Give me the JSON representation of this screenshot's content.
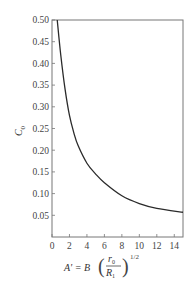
{
  "chart_data": {
    "type": "line",
    "title": "",
    "ylabel": "C_0",
    "ylabel_main": "C",
    "ylabel_sub": "0",
    "xlabel": "A' = B (r_0 / R_1)^(1/2)",
    "xlabel_parts": {
      "lhs": "A' = B",
      "num": "r",
      "num_sub": "0",
      "den": "R",
      "den_sub": "1",
      "exponent": "1/2"
    },
    "xlim": [
      0,
      15
    ],
    "ylim": [
      0,
      0.5
    ],
    "x_ticks": [
      "0",
      "2",
      "4",
      "6",
      "8",
      "10",
      "12",
      "14"
    ],
    "x_tick_values": [
      0,
      2,
      4,
      6,
      8,
      10,
      12,
      14
    ],
    "y_ticks": [
      "0.05",
      "0.10",
      "0.15",
      "0.20",
      "0.25",
      "0.30",
      "0.35",
      "0.40",
      "0.45",
      "0.50"
    ],
    "y_tick_values": [
      0.05,
      0.1,
      0.15,
      0.2,
      0.25,
      0.3,
      0.35,
      0.4,
      0.45,
      0.5
    ],
    "grid": false,
    "legend": null,
    "series": [
      {
        "name": "C0 vs A'",
        "x": [
          0.6,
          1.0,
          1.5,
          2.0,
          2.5,
          3.0,
          4.0,
          5.0,
          6.0,
          8.0,
          10.0,
          12.0,
          15.0
        ],
        "values": [
          0.5,
          0.42,
          0.34,
          0.28,
          0.24,
          0.21,
          0.17,
          0.145,
          0.125,
          0.095,
          0.077,
          0.066,
          0.057
        ]
      }
    ]
  }
}
